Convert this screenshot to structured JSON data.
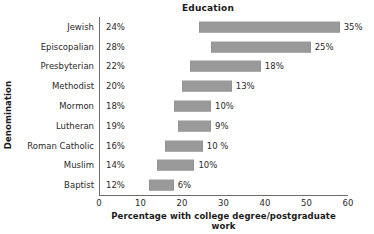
{
  "chart_data": {
    "type": "bar",
    "orientation": "horizontal",
    "bar_style": "floating-range",
    "title": "Education",
    "xlabel": "Percentage with college degree/postgraduate work",
    "ylabel": "Denomination",
    "xlim": [
      0,
      60
    ],
    "xticks": [
      0,
      10,
      20,
      30,
      40,
      50,
      60
    ],
    "xtick_labels": [
      "0",
      "10",
      "20",
      "30",
      "40",
      "50",
      "60"
    ],
    "grid": false,
    "legend": null,
    "bar_color": "#9a9a9a",
    "axis_color": "#6b6b6b",
    "categories": [
      "Jewish",
      "Episcopalian",
      "Presbyterian",
      "Methodist",
      "Mormon",
      "Lutheran",
      "Roman Catholic",
      "Muslim",
      "Baptist"
    ],
    "start_values": [
      24,
      28,
      22,
      20,
      18,
      19,
      16,
      14,
      12
    ],
    "start_labels": [
      "24%",
      "28%",
      "22%",
      "20%",
      "18%",
      "19%",
      "16%",
      "14%",
      "12%"
    ],
    "span_values": [
      35,
      25,
      18,
      13,
      10,
      9,
      10,
      10,
      6
    ],
    "span_labels": [
      "35%",
      "25%",
      "18%",
      "13%",
      "10%",
      "9%",
      "10 %",
      "10%",
      "6%"
    ],
    "bar_start": [
      24,
      27,
      22,
      20,
      18,
      19,
      16,
      14,
      12
    ],
    "bar_end": [
      58,
      51,
      39,
      32,
      27,
      27,
      25,
      23,
      18
    ],
    "rows": [
      {
        "category": "Jewish",
        "start_label": "24%",
        "span_label": "35%",
        "bar_start": 24,
        "bar_end": 58
      },
      {
        "category": "Episcopalian",
        "start_label": "28%",
        "span_label": "25%",
        "bar_start": 27,
        "bar_end": 51
      },
      {
        "category": "Presbyterian",
        "start_label": "22%",
        "span_label": "18%",
        "bar_start": 22,
        "bar_end": 39
      },
      {
        "category": "Methodist",
        "start_label": "20%",
        "span_label": "13%",
        "bar_start": 20,
        "bar_end": 32
      },
      {
        "category": "Mormon",
        "start_label": "18%",
        "span_label": "10%",
        "bar_start": 18,
        "bar_end": 27
      },
      {
        "category": "Lutheran",
        "start_label": "19%",
        "span_label": "9%",
        "bar_start": 19,
        "bar_end": 27
      },
      {
        "category": "Roman Catholic",
        "start_label": "16%",
        "span_label": "10 %",
        "bar_start": 16,
        "bar_end": 25
      },
      {
        "category": "Muslim",
        "start_label": "14%",
        "span_label": "10%",
        "bar_start": 14,
        "bar_end": 23
      },
      {
        "category": "Baptist",
        "start_label": "12%",
        "span_label": "6%",
        "bar_start": 12,
        "bar_end": 18
      }
    ]
  }
}
